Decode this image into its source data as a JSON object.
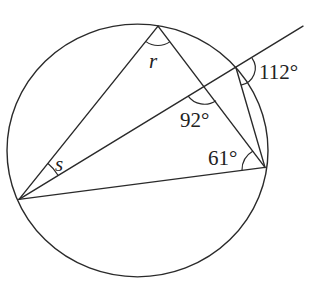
{
  "diagram": {
    "type": "circle-geometry",
    "circle": {
      "cx": 137.5,
      "cy": 155.5,
      "r": 130.5
    },
    "points": {
      "top": [
        158,
        27
      ],
      "left": [
        19,
        206
      ],
      "right": [
        265,
        173
      ],
      "chord_top": [
        236,
        70
      ],
      "ray_end": [
        303,
        27
      ],
      "intersection": [
        205,
        88
      ]
    },
    "labels": {
      "r": "r",
      "s": "s",
      "angle_92": "92°",
      "angle_61": "61°",
      "angle_112": "112°"
    }
  }
}
